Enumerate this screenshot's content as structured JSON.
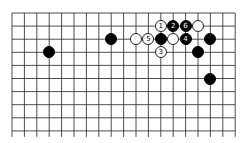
{
  "board": {
    "columns": 19,
    "rows_visible": 10,
    "origin_x": 12,
    "origin_y": 13,
    "spacing_x": 12.4,
    "spacing_y": 13.1,
    "line_color": "#222222",
    "background": "#ffffff"
  },
  "stones": [
    {
      "color": "white",
      "col": 12,
      "row": 1,
      "label": "1"
    },
    {
      "color": "black",
      "col": 13,
      "row": 1,
      "label": "2"
    },
    {
      "color": "black",
      "col": 14,
      "row": 1,
      "label": "6"
    },
    {
      "color": "white",
      "col": 15,
      "row": 1,
      "label": ""
    },
    {
      "color": "black",
      "col": 8,
      "row": 2,
      "label": ""
    },
    {
      "color": "white",
      "col": 10,
      "row": 2,
      "label": ""
    },
    {
      "color": "white",
      "col": 11,
      "row": 2,
      "label": "5"
    },
    {
      "color": "black",
      "col": 12,
      "row": 2,
      "label": ""
    },
    {
      "color": "white",
      "col": 13,
      "row": 2,
      "label": ""
    },
    {
      "color": "black",
      "col": 14,
      "row": 2,
      "label": "4"
    },
    {
      "color": "black",
      "col": 16,
      "row": 2,
      "label": ""
    },
    {
      "color": "black",
      "col": 3,
      "row": 3,
      "label": ""
    },
    {
      "color": "white",
      "col": 12,
      "row": 3,
      "label": "3"
    },
    {
      "color": "black",
      "col": 15,
      "row": 3,
      "label": ""
    },
    {
      "color": "black",
      "col": 16,
      "row": 5,
      "label": ""
    }
  ]
}
